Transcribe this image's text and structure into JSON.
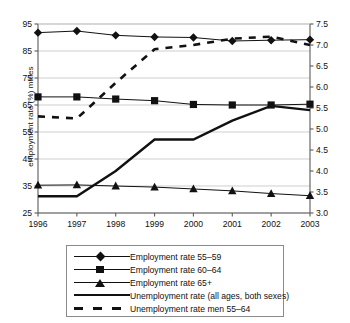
{
  "chart_data": {
    "type": "line",
    "title": "",
    "xlabel": "",
    "ylabel": "employment rate (%) males",
    "y2label": "unemployment rate (%)",
    "categories": [
      "1996",
      "1997",
      "1998",
      "1999",
      "2000",
      "2001",
      "2002",
      "2003"
    ],
    "x": [
      1996,
      1997,
      1998,
      1999,
      2000,
      2001,
      2002,
      2003
    ],
    "ylim": [
      25,
      95
    ],
    "yticks": [
      25,
      35,
      45,
      55,
      65,
      75,
      85,
      95
    ],
    "y2lim": [
      3.0,
      7.5
    ],
    "y2ticks": [
      3.0,
      3.5,
      4.0,
      4.5,
      5.0,
      5.5,
      6.0,
      6.5,
      7.0,
      7.5
    ],
    "grid": true,
    "legend_position": "below",
    "series": [
      {
        "name": "Employment rate 55–59",
        "axis": "left",
        "marker": "diamond",
        "style": "solid",
        "values": [
          91.8,
          92.4,
          90.8,
          90.2,
          90.0,
          88.7,
          89.0,
          89.2
        ]
      },
      {
        "name": "Employment rate 60–64",
        "axis": "left",
        "marker": "square",
        "style": "solid",
        "values": [
          68.0,
          68.0,
          67.2,
          66.6,
          65.2,
          65.0,
          65.0,
          65.3
        ]
      },
      {
        "name": "Employment rate 65+",
        "axis": "left",
        "marker": "triangle",
        "style": "solid",
        "values": [
          35.3,
          35.4,
          35.0,
          34.6,
          33.9,
          33.2,
          32.2,
          31.4
        ]
      },
      {
        "name": "Unemployment rate (all ages, both sexes)",
        "axis": "right",
        "marker": "none",
        "style": "solid-thick",
        "values": [
          3.4,
          3.4,
          4.0,
          4.75,
          4.75,
          5.2,
          5.55,
          5.45
        ]
      },
      {
        "name": "Unemployment rate men 55–64",
        "axis": "right",
        "marker": "none",
        "style": "dashed",
        "values": [
          5.3,
          5.25,
          6.1,
          6.9,
          7.0,
          7.15,
          7.2,
          7.0
        ]
      }
    ]
  },
  "legend": {
    "items": [
      {
        "label": "Employment rate 55–59",
        "key": "diamond-line-key"
      },
      {
        "label": "Employment rate 60–64",
        "key": "square-line-key"
      },
      {
        "label": "Employment rate 65+",
        "key": "triangle-line-key"
      },
      {
        "label": "Unemployment rate (all ages, both sexes)",
        "key": "thick-line-key"
      },
      {
        "label": "Unemployment rate men 55–64",
        "key": "dashed-line-key"
      }
    ]
  },
  "colors": {
    "ink": "#111111",
    "grid": "#b9b9b9",
    "axis": "#5a5a5a",
    "background": "#ffffff"
  }
}
